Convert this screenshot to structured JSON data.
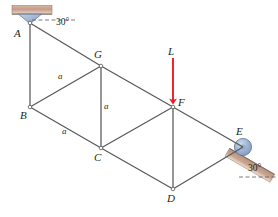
{
  "figure": {
    "type": "truss-free-body-diagram",
    "width": 278,
    "height": 217,
    "background": "#ffffff",
    "member_color": "#58595b",
    "load_color": "#ed1c24",
    "support_fill": "#a9bdd8",
    "support_hatch": "#caa08c",
    "label_color": "#231f20"
  },
  "nodes": [
    {
      "id": "A",
      "label": "A",
      "x": 30,
      "y": 23,
      "label_x": 14,
      "label_y": 28,
      "support": "pin"
    },
    {
      "id": "G",
      "label": "G",
      "x": 101,
      "y": 66,
      "label_x": 94,
      "label_y": 49,
      "support": "none"
    },
    {
      "id": "B",
      "label": "B",
      "x": 30,
      "y": 107,
      "label_x": 20,
      "label_y": 110,
      "support": "none"
    },
    {
      "id": "C",
      "label": "C",
      "x": 101,
      "y": 148,
      "label_x": 94,
      "label_y": 152,
      "support": "none"
    },
    {
      "id": "F",
      "label": "F",
      "x": 173,
      "y": 107,
      "label_x": 178,
      "label_y": 97,
      "support": "none"
    },
    {
      "id": "D",
      "label": "D",
      "x": 173,
      "y": 189,
      "label_x": 167,
      "label_y": 193,
      "support": "none"
    },
    {
      "id": "E",
      "label": "E",
      "x": 243,
      "y": 147,
      "label_x": 236,
      "label_y": 126,
      "support": "roller"
    }
  ],
  "members": [
    {
      "from": "A",
      "to": "B"
    },
    {
      "from": "A",
      "to": "G"
    },
    {
      "from": "G",
      "to": "B"
    },
    {
      "from": "G",
      "to": "C"
    },
    {
      "from": "G",
      "to": "F"
    },
    {
      "from": "B",
      "to": "C"
    },
    {
      "from": "C",
      "to": "F"
    },
    {
      "from": "C",
      "to": "D"
    },
    {
      "from": "F",
      "to": "D"
    },
    {
      "from": "F",
      "to": "E"
    },
    {
      "from": "D",
      "to": "E"
    }
  ],
  "dimension_labels": [
    {
      "text": "a",
      "member": "G-B",
      "x": 58,
      "y": 72
    },
    {
      "text": "a",
      "member": "G-C",
      "x": 104,
      "y": 102
    },
    {
      "text": "a",
      "member": "B-C",
      "x": 62,
      "y": 127
    }
  ],
  "angle_labels": [
    {
      "text": "30°",
      "at_node": "A",
      "x": 56,
      "y": 25
    },
    {
      "text": "30°",
      "at_node": "E",
      "x": 248,
      "y": 168
    }
  ],
  "load": {
    "label": "L",
    "label_x": 168,
    "label_y": 50,
    "tail_x": 173,
    "tail_y": 58,
    "head_x": 173,
    "head_y": 104,
    "color": "#ed1c24",
    "direction": "down"
  },
  "supports": {
    "pin_at_A": {
      "node": "A",
      "type": "pin",
      "hatch_rect": {
        "x": 12,
        "y": 6,
        "width": 40,
        "height": 8
      },
      "triangle_half_width": 12,
      "triangle_height": 11
    },
    "roller_at_E": {
      "node": "E",
      "type": "roller-on-incline",
      "incline_angle_deg": 30,
      "radius": 9
    }
  }
}
